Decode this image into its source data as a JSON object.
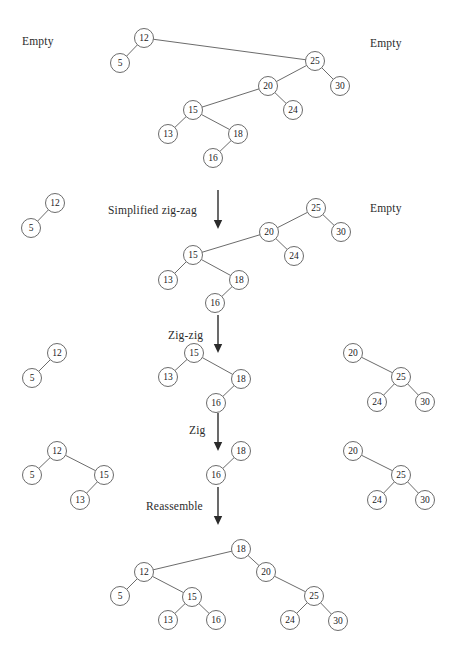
{
  "figure": {
    "type": "diagram",
    "node_radius": 9.5,
    "colors": {
      "stroke": "#5a5a5a",
      "fill": "#ffffff",
      "text": "#1a1a1a",
      "arrow": "#2b2b2b"
    }
  },
  "labels": [
    {
      "id": "empty-left-top",
      "text": "Empty",
      "x": 22,
      "y": 35
    },
    {
      "id": "empty-right-top",
      "text": "Empty",
      "x": 370,
      "y": 37
    },
    {
      "id": "op-zigzag",
      "text": "Simplified zig-zag",
      "x": 108,
      "y": 204
    },
    {
      "id": "empty-right-2",
      "text": "Empty",
      "x": 370,
      "y": 202
    },
    {
      "id": "op-zigzig",
      "text": "Zig-zig",
      "x": 168,
      "y": 329
    },
    {
      "id": "op-zig",
      "text": "Zig",
      "x": 189,
      "y": 424
    },
    {
      "id": "op-reassemble",
      "text": "Reassemble",
      "x": 146,
      "y": 500
    }
  ],
  "arrows": [
    {
      "id": "arrow-zigzag",
      "x": 218,
      "y1": 190,
      "y2": 229
    },
    {
      "id": "arrow-zigzig",
      "x": 218,
      "y1": 315,
      "y2": 353
    },
    {
      "id": "arrow-zig",
      "x": 218,
      "y1": 413,
      "y2": 451
    },
    {
      "id": "arrow-reassemble",
      "x": 218,
      "y1": 487,
      "y2": 525
    }
  ],
  "stages": [
    {
      "id": "stage-1-initial",
      "nodes": [
        {
          "v": "12",
          "x": 144,
          "y": 38
        },
        {
          "v": "5",
          "x": 120,
          "y": 63
        },
        {
          "v": "25",
          "x": 315,
          "y": 61
        },
        {
          "v": "30",
          "x": 340,
          "y": 86
        },
        {
          "v": "20",
          "x": 268,
          "y": 86
        },
        {
          "v": "24",
          "x": 293,
          "y": 110
        },
        {
          "v": "15",
          "x": 193,
          "y": 110
        },
        {
          "v": "13",
          "x": 168,
          "y": 134
        },
        {
          "v": "18",
          "x": 238,
          "y": 134
        },
        {
          "v": "16",
          "x": 213,
          "y": 158
        }
      ],
      "edges": [
        [
          "12",
          "5"
        ],
        [
          "12",
          "25"
        ],
        [
          "25",
          "30"
        ],
        [
          "25",
          "20"
        ],
        [
          "20",
          "24"
        ],
        [
          "20",
          "15"
        ],
        [
          "15",
          "13"
        ],
        [
          "15",
          "18"
        ],
        [
          "18",
          "16"
        ]
      ]
    },
    {
      "id": "stage-2-after-zigzag",
      "nodes": [
        {
          "v": "12",
          "x": 55,
          "y": 203
        },
        {
          "v": "5",
          "x": 31,
          "y": 228
        },
        {
          "v": "25",
          "x": 316,
          "y": 208
        },
        {
          "v": "30",
          "x": 341,
          "y": 232
        },
        {
          "v": "20",
          "x": 269,
          "y": 232
        },
        {
          "v": "24",
          "x": 294,
          "y": 256
        },
        {
          "v": "15",
          "x": 193,
          "y": 255
        },
        {
          "v": "13",
          "x": 168,
          "y": 280
        },
        {
          "v": "18",
          "x": 239,
          "y": 280
        },
        {
          "v": "16",
          "x": 215,
          "y": 303
        }
      ],
      "edges": [
        [
          "12",
          "5"
        ],
        [
          "25",
          "30"
        ],
        [
          "25",
          "20"
        ],
        [
          "20",
          "24"
        ],
        [
          "20",
          "15"
        ],
        [
          "15",
          "13"
        ],
        [
          "15",
          "18"
        ],
        [
          "18",
          "16"
        ]
      ]
    },
    {
      "id": "stage-3-after-zigzig",
      "nodes": [
        {
          "v": "12",
          "x": 57,
          "y": 353
        },
        {
          "v": "5",
          "x": 32,
          "y": 378
        },
        {
          "v": "15",
          "x": 194,
          "y": 353
        },
        {
          "v": "13",
          "x": 168,
          "y": 377
        },
        {
          "v": "18",
          "x": 241,
          "y": 379
        },
        {
          "v": "16",
          "x": 216,
          "y": 403
        },
        {
          "v": "20",
          "x": 353,
          "y": 353
        },
        {
          "v": "25",
          "x": 401,
          "y": 377
        },
        {
          "v": "24",
          "x": 377,
          "y": 402
        },
        {
          "v": "30",
          "x": 425,
          "y": 402
        }
      ],
      "edges": [
        [
          "12",
          "5"
        ],
        [
          "15",
          "13"
        ],
        [
          "15",
          "18"
        ],
        [
          "18",
          "16"
        ],
        [
          "20",
          "25"
        ],
        [
          "25",
          "24"
        ],
        [
          "25",
          "30"
        ]
      ]
    },
    {
      "id": "stage-4-after-zig",
      "nodes": [
        {
          "v": "12",
          "x": 57,
          "y": 451
        },
        {
          "v": "5",
          "x": 32,
          "y": 475
        },
        {
          "v": "15",
          "x": 104,
          "y": 475
        },
        {
          "v": "13",
          "x": 80,
          "y": 500
        },
        {
          "v": "18",
          "x": 241,
          "y": 451
        },
        {
          "v": "16",
          "x": 216,
          "y": 475
        },
        {
          "v": "20",
          "x": 353,
          "y": 451
        },
        {
          "v": "25",
          "x": 401,
          "y": 475
        },
        {
          "v": "24",
          "x": 377,
          "y": 500
        },
        {
          "v": "30",
          "x": 425,
          "y": 500
        }
      ],
      "edges": [
        [
          "12",
          "5"
        ],
        [
          "12",
          "15"
        ],
        [
          "15",
          "13"
        ],
        [
          "18",
          "16"
        ],
        [
          "20",
          "25"
        ],
        [
          "25",
          "24"
        ],
        [
          "25",
          "30"
        ]
      ]
    },
    {
      "id": "stage-5-reassembled",
      "nodes": [
        {
          "v": "18",
          "x": 241,
          "y": 549
        },
        {
          "v": "12",
          "x": 144,
          "y": 572
        },
        {
          "v": "20",
          "x": 266,
          "y": 572
        },
        {
          "v": "5",
          "x": 120,
          "y": 596
        },
        {
          "v": "15",
          "x": 192,
          "y": 597
        },
        {
          "v": "25",
          "x": 314,
          "y": 596
        },
        {
          "v": "13",
          "x": 168,
          "y": 620
        },
        {
          "v": "16",
          "x": 216,
          "y": 620
        },
        {
          "v": "24",
          "x": 290,
          "y": 620
        },
        {
          "v": "30",
          "x": 338,
          "y": 621
        }
      ],
      "edges": [
        [
          "18",
          "12"
        ],
        [
          "18",
          "20"
        ],
        [
          "12",
          "5"
        ],
        [
          "12",
          "15"
        ],
        [
          "15",
          "13"
        ],
        [
          "15",
          "16"
        ],
        [
          "20",
          "25"
        ],
        [
          "25",
          "24"
        ],
        [
          "25",
          "30"
        ]
      ]
    }
  ]
}
